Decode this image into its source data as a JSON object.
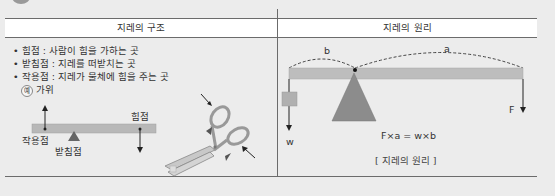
{
  "table": {
    "left_header": "지레의 구조",
    "right_header": "지레의 원리"
  },
  "structure": {
    "bullets": [
      "• 힘점 : 사람이 힘을 가하는 곳",
      "• 받침점 : 지레를 떠받치는 곳",
      "• 작용점 : 지레가 물체에 힘을 주는 곳"
    ],
    "example_badge": "예",
    "example_text": "가위",
    "diagram_labels": {
      "effort": "힘점",
      "load": "작용점",
      "fulcrum": "받침점"
    }
  },
  "principle": {
    "arc_left_label": "b",
    "arc_right_label": "a",
    "weight_label": "w",
    "force_label": "F",
    "formula": "F×a = w×b",
    "caption": "[ 지레의 원리 ]"
  },
  "colors": {
    "background": "#ececec",
    "bar": "#b8b8b8",
    "fulcrum": "#8c8c8c",
    "lines": "#6b6b6b"
  }
}
